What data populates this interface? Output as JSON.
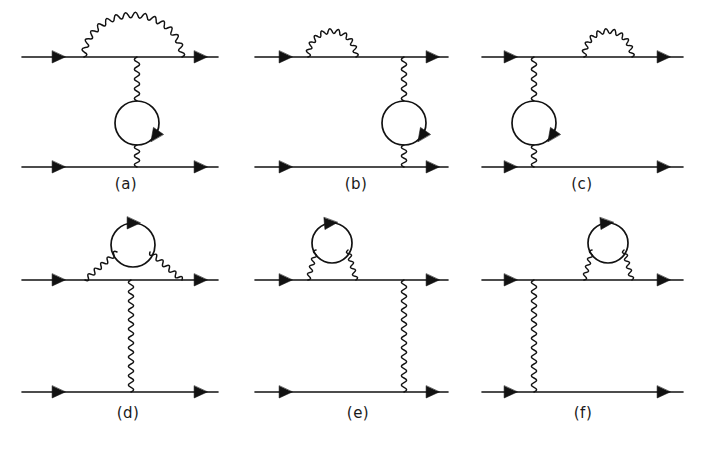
{
  "figure": {
    "width": 711,
    "height": 456,
    "background_color": "#ffffff",
    "ink_color": "#121212",
    "line_style": {
      "fermion": "straight line with mid arrowheads",
      "photon": "wavy line",
      "loop": "closed circle with arrowhead (fermion loop)"
    },
    "panel_count": 6,
    "panel_labels": [
      "(a)",
      "(b)",
      "(c)",
      "(d)",
      "(e)",
      "(f)"
    ]
  },
  "panels": [
    {
      "id": "a",
      "label": "(a)",
      "label_x": 126,
      "label_y": 189,
      "description": "Vertex-side self-energy arc over upper fermion line with vacuum polarization bubble on the exchanged photon",
      "top_line": {
        "x1": 22,
        "x2": 218,
        "y": 57
      },
      "bottom_line": {
        "x1": 22,
        "x2": 218,
        "y": 167
      },
      "top_arrows": [
        {
          "x": 58,
          "y": 57
        },
        {
          "x": 200,
          "y": 57
        }
      ],
      "bottom_arrows": [
        {
          "x": 58,
          "y": 167
        },
        {
          "x": 200,
          "y": 167
        }
      ],
      "photon_arcs": [
        {
          "x1": 84,
          "x2": 182,
          "y": 57,
          "height": 42,
          "wavelength": 9.5,
          "amplitude": 4.2
        }
      ],
      "photon_verticals": [
        {
          "x": 137,
          "y1": 57,
          "y2": 101,
          "wavelength": 9.5,
          "amplitude": 4.0
        },
        {
          "x": 137,
          "y1": 145,
          "y2": 167,
          "wavelength": 9.5,
          "amplitude": 4.0
        }
      ],
      "loops": [
        {
          "cx": 137,
          "cy": 123,
          "r": 22,
          "arrow_angle": 35
        }
      ]
    },
    {
      "id": "b",
      "label": "(b)",
      "label_x": 356,
      "label_y": 189,
      "description": "Self-energy bubble on the left of the upper fermion line, vacuum polarization bubble on the exchanged photon at right",
      "top_line": {
        "x1": 255,
        "x2": 448,
        "y": 57
      },
      "bottom_line": {
        "x1": 255,
        "x2": 448,
        "y": 167
      },
      "top_arrows": [
        {
          "x": 285,
          "y": 57
        },
        {
          "x": 432,
          "y": 57
        }
      ],
      "bottom_arrows": [
        {
          "x": 285,
          "y": 167
        },
        {
          "x": 432,
          "y": 167
        }
      ],
      "photon_arcs": [
        {
          "x1": 308,
          "x2": 356,
          "y": 57,
          "height": 26,
          "wavelength": 8.0,
          "amplitude": 3.6
        }
      ],
      "photon_verticals": [
        {
          "x": 404,
          "y1": 57,
          "y2": 101,
          "wavelength": 9.5,
          "amplitude": 4.0
        },
        {
          "x": 404,
          "y1": 145,
          "y2": 167,
          "wavelength": 9.5,
          "amplitude": 4.0
        }
      ],
      "loops": [
        {
          "cx": 404,
          "cy": 123,
          "r": 22,
          "arrow_angle": 35
        }
      ]
    },
    {
      "id": "c",
      "label": "(c)",
      "label_x": 582,
      "label_y": 189,
      "description": "Vacuum polarization bubble on the exchanged photon at left, self-energy bubble on the right of the upper fermion line",
      "top_line": {
        "x1": 482,
        "x2": 683,
        "y": 57
      },
      "bottom_line": {
        "x1": 482,
        "x2": 683,
        "y": 167
      },
      "top_arrows": [
        {
          "x": 510,
          "y": 57
        },
        {
          "x": 663,
          "y": 57
        }
      ],
      "bottom_arrows": [
        {
          "x": 510,
          "y": 167
        },
        {
          "x": 663,
          "y": 167
        }
      ],
      "photon_arcs": [
        {
          "x1": 584,
          "x2": 632,
          "y": 57,
          "height": 26,
          "wavelength": 8.0,
          "amplitude": 3.6
        }
      ],
      "photon_verticals": [
        {
          "x": 534,
          "y1": 57,
          "y2": 101,
          "wavelength": 9.5,
          "amplitude": 4.0
        },
        {
          "x": 534,
          "y1": 145,
          "y2": 167,
          "wavelength": 9.5,
          "amplitude": 4.0
        }
      ],
      "loops": [
        {
          "cx": 534,
          "cy": 123,
          "r": 22,
          "arrow_angle": 35
        }
      ]
    },
    {
      "id": "d",
      "label": "(d)",
      "label_x": 128,
      "label_y": 418,
      "description": "Wide self-energy photon arc on the upper fermion line containing a vacuum polarization bubble; plain exchanged photon",
      "top_line": {
        "x1": 22,
        "x2": 218,
        "y": 280
      },
      "bottom_line": {
        "x1": 22,
        "x2": 218,
        "y": 392
      },
      "top_arrows": [
        {
          "x": 58,
          "y": 280
        },
        {
          "x": 200,
          "y": 280
        }
      ],
      "bottom_arrows": [
        {
          "x": 58,
          "y": 392
        },
        {
          "x": 200,
          "y": 392
        }
      ],
      "photon_legs": [
        {
          "x1": 85,
          "y1": 280,
          "x2": 117,
          "y2": 252,
          "wavelength": 8.5,
          "amplitude": 3.6
        },
        {
          "x1": 182,
          "y1": 280,
          "x2": 150,
          "y2": 252,
          "wavelength": 8.5,
          "amplitude": 3.6
        }
      ],
      "photon_verticals": [
        {
          "x": 131,
          "y1": 280,
          "y2": 392,
          "wavelength": 9.5,
          "amplitude": 4.0
        }
      ],
      "loops": [
        {
          "cx": 133,
          "cy": 245,
          "r": 22,
          "arrow_angle": 270
        }
      ]
    },
    {
      "id": "e",
      "label": "(e)",
      "label_x": 358,
      "label_y": 418,
      "description": "Narrow self-energy photon arc with vacuum polarization bubble at the left of the upper fermion line; plain exchanged photon at right",
      "top_line": {
        "x1": 255,
        "x2": 448,
        "y": 280
      },
      "bottom_line": {
        "x1": 255,
        "x2": 448,
        "y": 392
      },
      "top_arrows": [
        {
          "x": 285,
          "y": 280
        },
        {
          "x": 432,
          "y": 280
        }
      ],
      "bottom_arrows": [
        {
          "x": 285,
          "y": 392
        },
        {
          "x": 432,
          "y": 392
        }
      ],
      "photon_legs": [
        {
          "x1": 308,
          "y1": 280,
          "x2": 316,
          "y2": 250,
          "wavelength": 7.5,
          "amplitude": 3.2
        },
        {
          "x1": 356,
          "y1": 280,
          "x2": 348,
          "y2": 250,
          "wavelength": 7.5,
          "amplitude": 3.2
        }
      ],
      "photon_verticals": [
        {
          "x": 404,
          "y1": 280,
          "y2": 392,
          "wavelength": 9.5,
          "amplitude": 4.0
        }
      ],
      "loops": [
        {
          "cx": 332,
          "cy": 243,
          "r": 20,
          "arrow_angle": 265
        }
      ]
    },
    {
      "id": "f",
      "label": "(f)",
      "label_x": 583,
      "label_y": 418,
      "description": "Plain exchanged photon at left; narrow self-energy photon arc with vacuum polarization bubble at the right of the upper fermion line",
      "top_line": {
        "x1": 482,
        "x2": 683,
        "y": 280
      },
      "bottom_line": {
        "x1": 482,
        "x2": 683,
        "y": 392
      },
      "top_arrows": [
        {
          "x": 510,
          "y": 280
        },
        {
          "x": 663,
          "y": 280
        }
      ],
      "bottom_arrows": [
        {
          "x": 510,
          "y": 392
        },
        {
          "x": 663,
          "y": 392
        }
      ],
      "photon_legs": [
        {
          "x1": 584,
          "y1": 280,
          "x2": 592,
          "y2": 250,
          "wavelength": 7.5,
          "amplitude": 3.2
        },
        {
          "x1": 632,
          "y1": 280,
          "x2": 624,
          "y2": 250,
          "wavelength": 7.5,
          "amplitude": 3.2
        }
      ],
      "photon_verticals": [
        {
          "x": 534,
          "y1": 280,
          "y2": 392,
          "wavelength": 9.5,
          "amplitude": 4.0
        }
      ],
      "loops": [
        {
          "cx": 608,
          "cy": 243,
          "r": 20,
          "arrow_angle": 265
        }
      ]
    }
  ]
}
